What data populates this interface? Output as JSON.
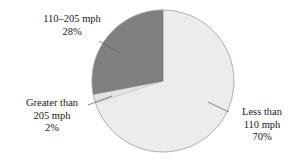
{
  "chart_data": {
    "type": "pie",
    "title": "",
    "subtitle": "",
    "xlabel": "",
    "ylabel": "",
    "legend_position": "none",
    "grid": false,
    "categories": [
      "110–205 mph",
      "Greater than 205 mph",
      "Less than 110 mph"
    ],
    "values": [
      28,
      2,
      70
    ],
    "value_unit": "%",
    "slices": [
      {
        "label": "110–205 mph",
        "label_line1": "110–205 mph",
        "label_line2": "28%",
        "value": 28,
        "value_text": "28%",
        "color": "#808080",
        "start_angle_deg": 90,
        "end_angle_deg": 190.8
      },
      {
        "label": "Greater than 205 mph",
        "label_line1": "Greater than",
        "label_line2": "205 mph",
        "label_line3": "2%",
        "value": 2,
        "value_text": "2%",
        "color": "#e3e3e3",
        "start_angle_deg": 190.8,
        "end_angle_deg": 198.0
      },
      {
        "label": "Less than 110 mph",
        "label_line1": "Less than",
        "label_line2": "110 mph",
        "label_line3": "70%",
        "value": 70,
        "value_text": "70%",
        "color": "#ececec",
        "start_angle_deg": 198.0,
        "end_angle_deg": 450.0
      }
    ],
    "colors": {
      "slice_mid_speed": "#808080",
      "slice_high_speed": "#e3e3e3",
      "slice_low_speed": "#ececec",
      "outline": "#9a9a9a",
      "leader_line": "#555555",
      "text": "#1a1a1a",
      "background": "#ffffff"
    },
    "geometry": {
      "center_x": 163,
      "center_y": 81,
      "radius": 71
    }
  }
}
